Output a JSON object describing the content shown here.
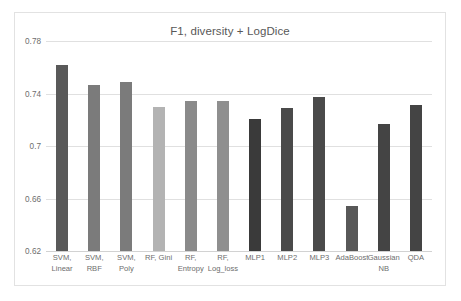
{
  "chart_data": {
    "type": "bar",
    "title": "F1, diversity + LogDice",
    "xlabel": "",
    "ylabel": "",
    "ylim": [
      0.62,
      0.78
    ],
    "yticks": [
      "0.62",
      "0.66",
      "0.7",
      "0.74",
      "0.78"
    ],
    "ytick_values": [
      0.62,
      0.66,
      0.7,
      0.74,
      0.78
    ],
    "grid": true,
    "legend": false,
    "categories": [
      "SVM, Linear",
      "SVM, RBF",
      "SVM, Poly",
      "RF, Gini",
      "RF, Entropy",
      "RF, Log_loss",
      "MLP1",
      "MLP2",
      "MLP3",
      "AdaBoost",
      "Gaussian NB",
      "QDA"
    ],
    "values": [
      0.7615,
      0.7465,
      0.749,
      0.73,
      0.7345,
      0.7345,
      0.7205,
      0.729,
      0.7375,
      0.6545,
      0.7165,
      0.7315
    ],
    "bar_colors": [
      "#595959",
      "#7b7b7b",
      "#7b7b7b",
      "#b3b3b3",
      "#8a8a8a",
      "#8f8f8f",
      "#3a3a3a",
      "#4a4a4a",
      "#4a4a4a",
      "#585858",
      "#444444",
      "#444444"
    ]
  },
  "style": {
    "title_color": "#585858",
    "tick_color": "#6d6d6d",
    "grid_color": "#e0e0e0",
    "plot_bg": "#ffffff",
    "border_color": "#e2e2e2"
  }
}
